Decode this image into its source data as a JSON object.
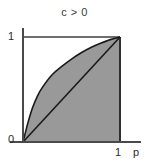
{
  "chart_data": {
    "type": "area",
    "title": "c > 0",
    "xlabel": "p",
    "ylabel": "",
    "xlim": [
      0,
      1
    ],
    "ylim": [
      0,
      1
    ],
    "xticks": [
      "0",
      "1"
    ],
    "yticks": [
      "0",
      "1"
    ],
    "grid": false,
    "legend": null,
    "annotations": [
      "c > 0"
    ],
    "fill_color": "#999999",
    "line_color": "#1a1a1a",
    "axis_color": "#4a4a4a",
    "series": [
      {
        "name": "concave-curve",
        "comment": "upper boundary: concave increasing curve from (0,0) to (1,1), lies above diagonal",
        "x": [
          0.0,
          0.05,
          0.1,
          0.15,
          0.2,
          0.3,
          0.4,
          0.5,
          0.6,
          0.7,
          0.8,
          0.9,
          1.0
        ],
        "y": [
          0.0,
          0.18,
          0.33,
          0.44,
          0.52,
          0.64,
          0.72,
          0.79,
          0.85,
          0.9,
          0.94,
          0.975,
          1.0
        ]
      },
      {
        "name": "diagonal",
        "comment": "identity line y = p from (0,0) to (1,1)",
        "x": [
          0.0,
          1.0
        ],
        "y": [
          0.0,
          1.0
        ]
      }
    ],
    "shaded_region": {
      "name": "area-under-curve",
      "description": "region bounded by the concave curve above, the x-axis below and the line p = 1 on the right"
    }
  },
  "labels": {
    "title": "c > 0",
    "y_top": "1",
    "y_bottom": "0",
    "x_right": "1",
    "x_axis_name": "p"
  }
}
